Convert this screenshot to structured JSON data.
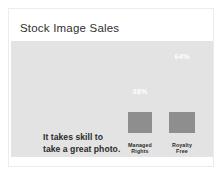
{
  "card": {
    "title": "Stock Image Sales",
    "caption_line1": "It takes skill to",
    "caption_line2": "take a great photo."
  },
  "colors": {
    "panel_background": "#e3e3e3",
    "bar_upper": "#b1b1b1",
    "bar_lower": "#8e8e8e",
    "title_text": "#2f2f2f",
    "value_text": "#ffffff",
    "card_background": "#ffffff"
  },
  "chart_data": {
    "type": "bar",
    "title": "Stock Image Sales",
    "xlabel": "",
    "ylabel": "",
    "ylim": [
      0,
      100
    ],
    "grid": false,
    "legend": "none",
    "categories": [
      "Managed Rights",
      "Royalty Free"
    ],
    "category_labels": [
      {
        "line1": "Managed",
        "line2": "Rights"
      },
      {
        "line1": "Royalty",
        "line2": "Free"
      }
    ],
    "values": [
      38,
      64
    ],
    "value_labels": [
      "38%",
      "64%"
    ],
    "annotation": "It takes skill to take a great photo."
  }
}
